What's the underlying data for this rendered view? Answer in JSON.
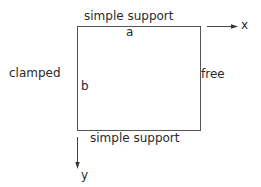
{
  "diagram": {
    "plate": {
      "top_edge": "simple support",
      "bottom_edge": "simple support",
      "left_edge": "clamped",
      "right_edge": "free",
      "width_label": "a",
      "height_label": "b"
    },
    "axes": {
      "x_label": "x",
      "y_label": "y"
    },
    "colors": {
      "line": "#555555",
      "text": "#2a2a2a"
    }
  }
}
